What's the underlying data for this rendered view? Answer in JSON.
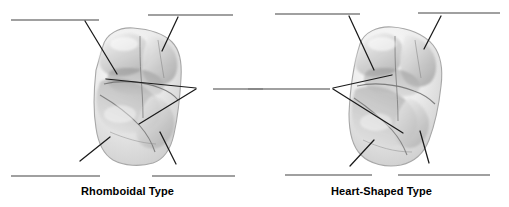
{
  "figure": {
    "width": 509,
    "height": 207,
    "background_color": "#ffffff",
    "panels": [
      {
        "id": "left-panel",
        "caption": "Rhomboidal Type",
        "specimen_name": "maxillary-molar-occlusal-rhomboidal",
        "answer_lines": [
          {
            "id": "left-top-left",
            "x1": 11,
            "y1": 20,
            "x2": 99,
            "y2": 20
          },
          {
            "id": "left-top-right",
            "x1": 148,
            "y1": 15,
            "x2": 233,
            "y2": 15
          },
          {
            "id": "left-middle-right",
            "x1": 213,
            "y1": 89,
            "x2": 263,
            "y2": 89
          },
          {
            "id": "left-bottom-left",
            "x1": 11,
            "y1": 176,
            "x2": 100,
            "y2": 176
          },
          {
            "id": "left-bottom-right",
            "x1": 152,
            "y1": 176,
            "x2": 235,
            "y2": 176
          }
        ],
        "leader_lines": [
          {
            "id": "left-leader-top-left",
            "x1": 85,
            "y1": 21,
            "x2": 117,
            "y2": 74
          },
          {
            "id": "left-leader-top-right",
            "x1": 178,
            "y1": 17,
            "x2": 162,
            "y2": 51
          },
          {
            "id": "left-leader-middle-upper",
            "x1": 196,
            "y1": 88,
            "x2": 106,
            "y2": 79
          },
          {
            "id": "left-leader-middle-lower",
            "x1": 196,
            "y1": 89,
            "x2": 139,
            "y2": 124
          },
          {
            "id": "left-leader-bottom-left",
            "x1": 80,
            "y1": 161,
            "x2": 110,
            "y2": 137
          },
          {
            "id": "left-leader-bottom-right",
            "x1": 176,
            "y1": 164,
            "x2": 160,
            "y2": 132
          }
        ]
      },
      {
        "id": "right-panel",
        "caption": "Heart-Shaped Type",
        "specimen_name": "maxillary-molar-occlusal-heart-shaped",
        "answer_lines": [
          {
            "id": "right-top-left",
            "x1": 275,
            "y1": 14,
            "x2": 360,
            "y2": 14
          },
          {
            "id": "right-top-right",
            "x1": 418,
            "y1": 13,
            "x2": 500,
            "y2": 13
          },
          {
            "id": "right-middle-left",
            "x1": 213,
            "y1": 89,
            "x2": 330,
            "y2": 89
          },
          {
            "id": "right-bottom-left",
            "x1": 285,
            "y1": 175,
            "x2": 372,
            "y2": 175
          },
          {
            "id": "right-bottom-right",
            "x1": 398,
            "y1": 175,
            "x2": 490,
            "y2": 175
          }
        ],
        "leader_lines": [
          {
            "id": "right-leader-top-left",
            "x1": 349,
            "y1": 16,
            "x2": 374,
            "y2": 70
          },
          {
            "id": "right-leader-top-right",
            "x1": 441,
            "y1": 16,
            "x2": 424,
            "y2": 49
          },
          {
            "id": "right-leader-middle-upper",
            "x1": 333,
            "y1": 88,
            "x2": 392,
            "y2": 75
          },
          {
            "id": "right-leader-middle-lower",
            "x1": 333,
            "y1": 89,
            "x2": 403,
            "y2": 133
          },
          {
            "id": "right-leader-bottom-left",
            "x1": 350,
            "y1": 166,
            "x2": 374,
            "y2": 140
          },
          {
            "id": "right-leader-bottom-right",
            "x1": 429,
            "y1": 163,
            "x2": 420,
            "y2": 131
          }
        ]
      }
    ],
    "colors": {
      "answer_line": "#808080",
      "leader_line": "#1a1a1a",
      "caption_text": "#000000",
      "tooth_outline": "#9a9a9a",
      "tooth_fill_light": "#f2f2f2",
      "tooth_fill_mid": "#d8d8d8",
      "tooth_fill_dark": "#9e9e9e",
      "groove_line": "#6b6b6b"
    }
  }
}
